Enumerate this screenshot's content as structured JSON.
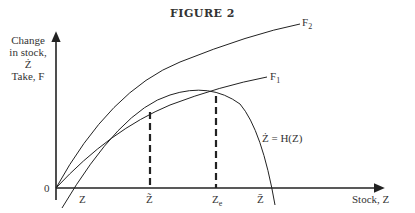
{
  "title": "FIGURE 2",
  "y_axis_label": [
    "Change",
    "in stock,",
    "Ż",
    "Take, F"
  ],
  "x_axis_label": "Stock, Z",
  "origin_label": "0",
  "curve_labels": {
    "f2": "F",
    "f2_sub": "2",
    "f1": "F",
    "f1_sub": "1",
    "h": "Ż = H(Z)"
  },
  "x_ticks": {
    "z_min": "Z",
    "z_tilde": "Z̃",
    "z_e": "Z",
    "z_e_sub": "e",
    "z_bar": "Z̄"
  },
  "colors": {
    "line": "#222222",
    "text": "#333333"
  }
}
